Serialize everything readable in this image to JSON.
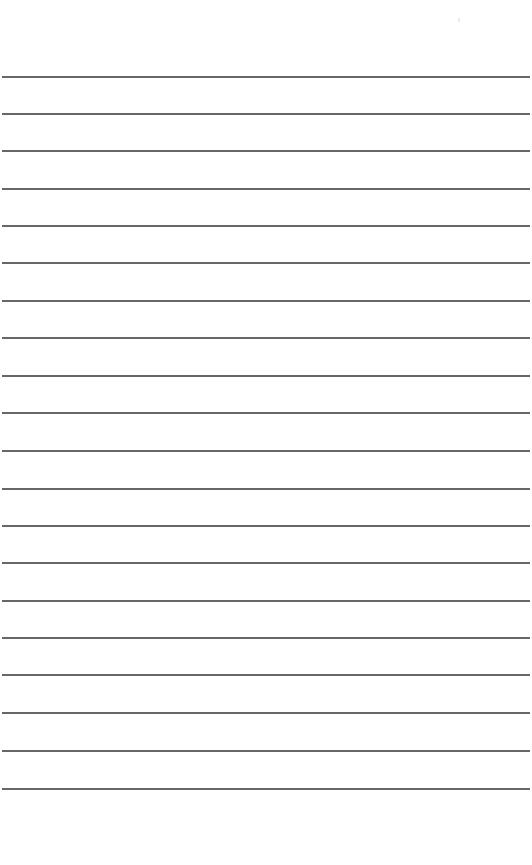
{
  "document": {
    "type": "lined-paper",
    "background_color": "#ffffff",
    "rule_color": "#5a5a5a",
    "rule_count": 20,
    "rules_y": [
      76,
      113,
      150,
      188,
      225,
      262,
      300,
      337,
      375,
      412,
      450,
      488,
      525,
      562,
      600,
      637,
      674,
      712,
      750,
      788
    ],
    "text_lines": [
      "",
      "",
      "",
      "",
      "",
      "",
      "",
      "",
      "",
      "",
      "",
      "",
      "",
      "",
      "",
      "",
      "",
      "",
      "",
      ""
    ]
  }
}
